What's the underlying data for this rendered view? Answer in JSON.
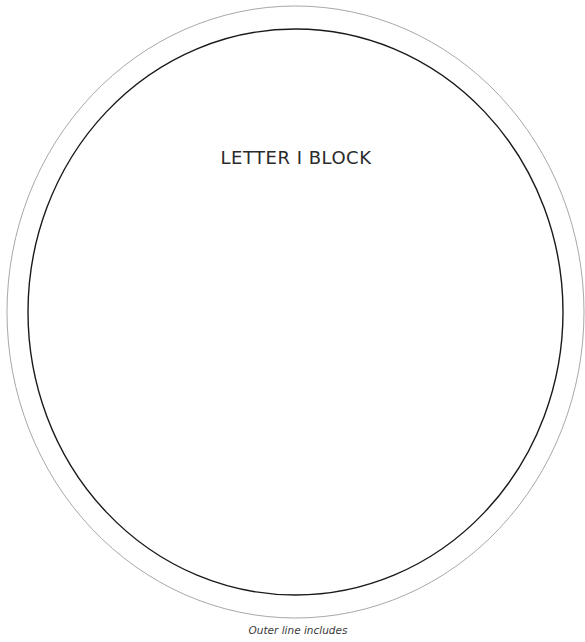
{
  "template": {
    "title": "LETTER I BLOCK",
    "caption": "Outer line includes",
    "shapes": {
      "outer_ellipse": {
        "cx": 295.5,
        "cy": 312,
        "rx": 288.5,
        "ry": 306,
        "stroke": "#a8a8a8"
      },
      "inner_ellipse": {
        "cx": 295.5,
        "cy": 312,
        "rx": 267.5,
        "ry": 283,
        "stroke": "#1a1a1a"
      }
    }
  }
}
